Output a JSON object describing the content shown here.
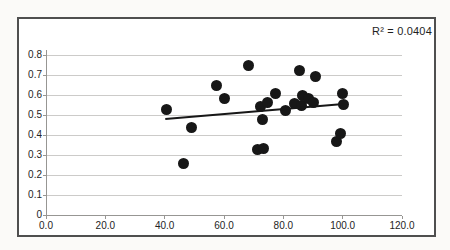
{
  "chart_data": {
    "type": "scatter",
    "title": "",
    "annotation": "R² = 0.0404",
    "r_squared": 0.0404,
    "xlabel": "",
    "ylabel": "",
    "xlim": [
      0,
      120
    ],
    "ylim": [
      0,
      0.8
    ],
    "x_tick_values": [
      0,
      20,
      40,
      60,
      80,
      100,
      120
    ],
    "x_tick_labels": [
      "0.0",
      "20.0",
      "40.0",
      "60.0",
      "80.0",
      "100.0",
      "120.0"
    ],
    "y_tick_values": [
      0,
      0.1,
      0.2,
      0.3,
      0.4,
      0.5,
      0.6,
      0.7,
      0.8
    ],
    "y_tick_labels": [
      "0",
      "0.1",
      "0.2",
      "0.3",
      "0.4",
      "0.5",
      "0.6",
      "0.7",
      "0.8"
    ],
    "grid": "horizontal",
    "legend": "none",
    "points": [
      [
        40.7,
        0.53
      ],
      [
        46.4,
        0.26
      ],
      [
        49.2,
        0.44
      ],
      [
        57.6,
        0.65
      ],
      [
        60.3,
        0.585
      ],
      [
        68.1,
        0.75
      ],
      [
        71.2,
        0.33
      ],
      [
        73.2,
        0.335
      ],
      [
        72.9,
        0.48
      ],
      [
        72.2,
        0.545
      ],
      [
        74.6,
        0.565
      ],
      [
        77.3,
        0.61
      ],
      [
        80.7,
        0.525
      ],
      [
        83.7,
        0.56
      ],
      [
        86.1,
        0.55
      ],
      [
        86.4,
        0.6
      ],
      [
        88.5,
        0.585
      ],
      [
        90.2,
        0.565
      ],
      [
        85.4,
        0.725
      ],
      [
        90.8,
        0.695
      ],
      [
        98.0,
        0.37
      ],
      [
        99.3,
        0.41
      ],
      [
        100.0,
        0.61
      ],
      [
        100.3,
        0.555
      ]
    ],
    "trendline": {
      "type": "linear",
      "x1": 40.2,
      "y1": 0.48,
      "x2": 100.3,
      "y2": 0.555
    },
    "colors": {
      "point": "#171717",
      "trend": "#171717",
      "grid": "#cccbc9",
      "axis": "#979693",
      "frame_border": "#4f4f4f",
      "plot_background": "#ffffff",
      "text": "#242424"
    }
  }
}
